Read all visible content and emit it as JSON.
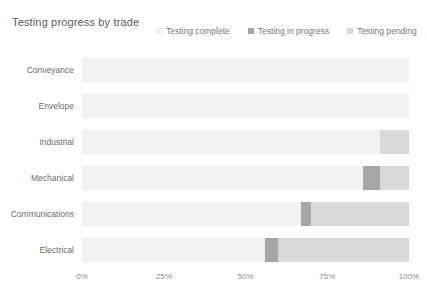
{
  "chart_data": {
    "type": "bar",
    "orientation": "horizontal",
    "stacked": true,
    "normalized": true,
    "title": "Testing progress by trade",
    "xlabel": "",
    "ylabel": "",
    "xlim": [
      0,
      100
    ],
    "xticks": [
      0,
      25,
      50,
      75,
      100
    ],
    "xticklabels": [
      "0%",
      "25%",
      "50%",
      "75%",
      "100%"
    ],
    "grid": false,
    "legend_position": "top-right",
    "categories": [
      "Conveyance",
      "Envelope",
      "Industrial",
      "Mechanical",
      "Communications",
      "Electrical"
    ],
    "series": [
      {
        "name": "Testing complete",
        "color": "#f2f2f2",
        "values": [
          100,
          100,
          91,
          86,
          67,
          56
        ]
      },
      {
        "name": "Testing in progress",
        "color": "#a6a6a6",
        "values": [
          0,
          0,
          0,
          5,
          3,
          4
        ]
      },
      {
        "name": "Testing pending",
        "color": "#d9d9d9",
        "values": [
          0,
          0,
          9,
          9,
          30,
          40
        ]
      }
    ]
  },
  "legend": {
    "items": [
      {
        "label": "Testing complete",
        "color": "#f2f2f2"
      },
      {
        "label": "Testing in progress",
        "color": "#a6a6a6"
      },
      {
        "label": "Testing pending",
        "color": "#d9d9d9"
      }
    ]
  }
}
